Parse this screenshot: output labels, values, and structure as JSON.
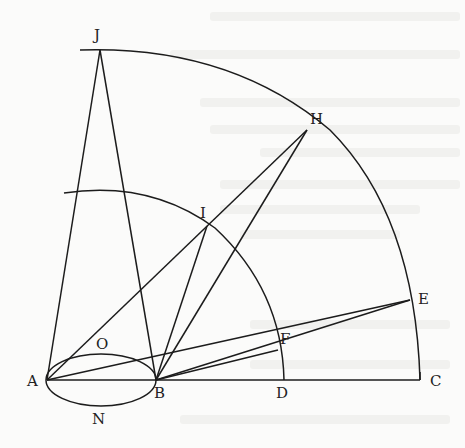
{
  "diagram": {
    "type": "geometric construction",
    "labels": {
      "J": "J",
      "H": "H",
      "I": "I",
      "E": "E",
      "F": "F",
      "O": "O",
      "N": "N",
      "A": "A",
      "B": "B",
      "D": "D",
      "C": "C"
    },
    "points": {
      "A": [
        47,
        380
      ],
      "B": [
        156,
        380
      ],
      "D": [
        284,
        380
      ],
      "C": [
        420,
        380
      ],
      "J": [
        100,
        50
      ],
      "H": [
        307,
        130
      ],
      "I": [
        207,
        226
      ],
      "F": [
        278,
        350
      ],
      "E": [
        410,
        300
      ]
    },
    "colors": {
      "ink": "#1c1c1c",
      "background": "#fbfbfa"
    }
  }
}
